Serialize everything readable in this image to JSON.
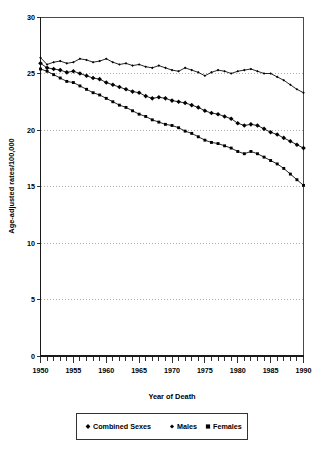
{
  "chart_data": {
    "type": "line",
    "title": "",
    "xlabel": "Year of Death",
    "ylabel": "Age-adjusted rates/100,000",
    "xlim": [
      1950,
      1990
    ],
    "ylim": [
      0,
      30
    ],
    "grid": true,
    "grid_axis": "y",
    "legend_position": "bottom",
    "xticks": [
      1950,
      1955,
      1960,
      1965,
      1970,
      1975,
      1980,
      1985,
      1990
    ],
    "xtick_labels": [
      "1950",
      "1955",
      "1960",
      "1965",
      "1970",
      "1975",
      "1980",
      "1985",
      "1990"
    ],
    "xtick_minor_step": 1,
    "yticks": [
      0,
      5,
      10,
      15,
      20,
      25,
      30
    ],
    "ytick_labels": [
      "0",
      "5",
      "10",
      "15",
      "20",
      "25",
      "30"
    ],
    "x": [
      1950,
      1951,
      1952,
      1953,
      1954,
      1955,
      1956,
      1957,
      1958,
      1959,
      1960,
      1961,
      1962,
      1963,
      1964,
      1965,
      1966,
      1967,
      1968,
      1969,
      1970,
      1971,
      1972,
      1973,
      1974,
      1975,
      1976,
      1977,
      1978,
      1979,
      1980,
      1981,
      1982,
      1983,
      1984,
      1985,
      1986,
      1987,
      1988,
      1989,
      1990
    ],
    "series": [
      {
        "name": "Combined Sexes",
        "marker": "diamond-large",
        "marker_size": 4.6,
        "values": [
          25.9,
          25.5,
          25.4,
          25.3,
          25.1,
          25.2,
          25.0,
          24.8,
          24.6,
          24.5,
          24.2,
          24.0,
          23.8,
          23.6,
          23.4,
          23.3,
          23.0,
          22.8,
          22.9,
          22.8,
          22.6,
          22.5,
          22.4,
          22.2,
          22.0,
          21.7,
          21.5,
          21.4,
          21.2,
          21.0,
          20.6,
          20.4,
          20.5,
          20.4,
          20.1,
          19.8,
          19.6,
          19.3,
          19.0,
          18.7,
          18.4
        ]
      },
      {
        "name": "Males",
        "marker": "diamond-small",
        "marker_size": 2.6,
        "values": [
          26.4,
          25.8,
          26.0,
          26.1,
          25.9,
          26.0,
          26.3,
          26.2,
          26.0,
          26.1,
          26.3,
          26.0,
          25.8,
          25.9,
          25.7,
          25.8,
          25.6,
          25.5,
          25.7,
          25.5,
          25.3,
          25.2,
          25.5,
          25.3,
          25.1,
          24.8,
          25.1,
          25.3,
          25.2,
          25.0,
          25.2,
          25.3,
          25.4,
          25.2,
          25.0,
          25.0,
          24.7,
          24.4,
          24.0,
          23.6,
          23.3
        ]
      },
      {
        "name": "Females",
        "marker": "square",
        "marker_size": 2.9,
        "values": [
          25.4,
          25.2,
          24.9,
          24.6,
          24.3,
          24.2,
          23.9,
          23.6,
          23.3,
          23.1,
          22.8,
          22.5,
          22.2,
          22.0,
          21.7,
          21.4,
          21.2,
          20.9,
          20.7,
          20.5,
          20.4,
          20.2,
          19.9,
          19.7,
          19.4,
          19.1,
          18.9,
          18.8,
          18.6,
          18.4,
          18.1,
          17.9,
          18.1,
          17.9,
          17.6,
          17.3,
          17.0,
          16.6,
          16.1,
          15.6,
          15.1
        ]
      }
    ],
    "legend_items": [
      {
        "label": "Combined Sexes",
        "marker": "diamond-large"
      },
      {
        "label": "Males",
        "marker": "diamond-small"
      },
      {
        "label": "Females",
        "marker": "square"
      }
    ]
  }
}
